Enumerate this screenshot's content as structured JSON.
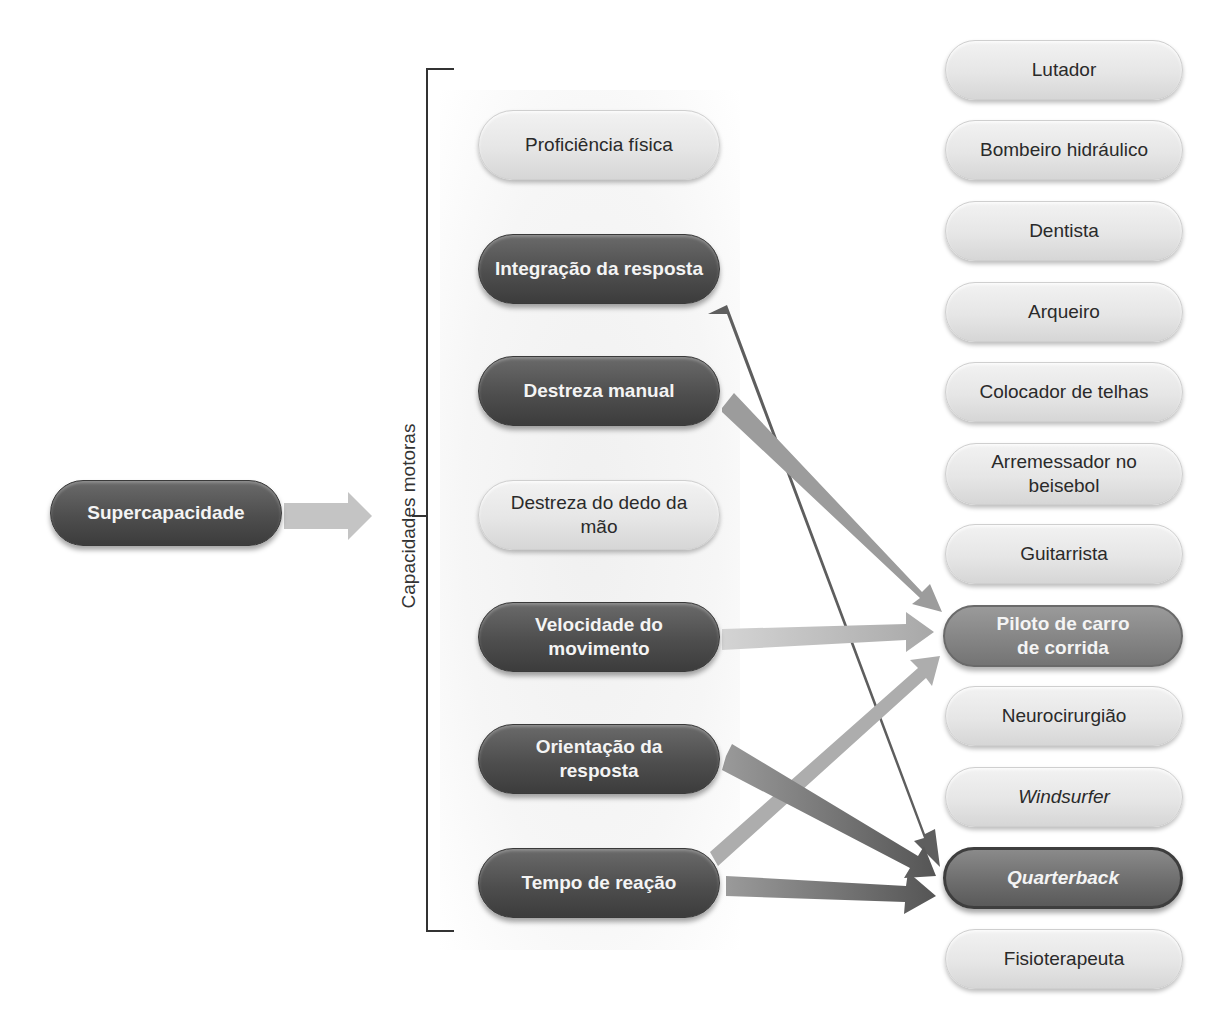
{
  "diagram": {
    "source": {
      "label": "Supercapacidade"
    },
    "group_label": "Capacidades motoras",
    "abilities": [
      {
        "label": "Proficiência física",
        "style": "light"
      },
      {
        "label": "Integração da resposta",
        "style": "dark"
      },
      {
        "label": "Destreza manual",
        "style": "dark"
      },
      {
        "label": "Destreza do dedo da mão",
        "style": "light"
      },
      {
        "label": "Velocidade do movimento",
        "style": "dark"
      },
      {
        "label": "Orientação da resposta",
        "style": "dark"
      },
      {
        "label": "Tempo de reação",
        "style": "dark"
      }
    ],
    "occupations": [
      {
        "label": "Lutador",
        "style": "light"
      },
      {
        "label": "Bombeiro hidráulico",
        "style": "light"
      },
      {
        "label": "Dentista",
        "style": "light"
      },
      {
        "label": "Arqueiro",
        "style": "light"
      },
      {
        "label": "Colocador de telhas",
        "style": "light"
      },
      {
        "label": "Arremessador no beisebol",
        "style": "light"
      },
      {
        "label": "Guitarrista",
        "style": "light"
      },
      {
        "label": "Piloto de carro de corrida",
        "style": "mid-highlight"
      },
      {
        "label": "Neurocirurgião",
        "style": "light"
      },
      {
        "label": "Windsurfer",
        "style": "light-italic"
      },
      {
        "label": "Quarterback",
        "style": "dark-highlight-italic"
      },
      {
        "label": "Fisioterapeuta",
        "style": "light"
      }
    ],
    "connections": [
      {
        "from": "Integração da resposta",
        "to": "Quarterback"
      },
      {
        "from": "Destreza manual",
        "to": "Piloto de carro de corrida"
      },
      {
        "from": "Velocidade do movimento",
        "to": "Piloto de carro de corrida"
      },
      {
        "from": "Orientação da resposta",
        "to": "Quarterback"
      },
      {
        "from": "Tempo de reação",
        "to": "Piloto de carro de corrida"
      },
      {
        "from": "Tempo de reação",
        "to": "Quarterback"
      },
      {
        "from": "Supercapacidade",
        "to": "Capacidades motoras"
      }
    ],
    "colors": {
      "dark_node": "#4e4e4e",
      "light_node": "#e6e6e6",
      "highlight_mid": "#858585",
      "arrow_light": "#b8b8b8",
      "arrow_dark": "#5a5a5a"
    }
  }
}
